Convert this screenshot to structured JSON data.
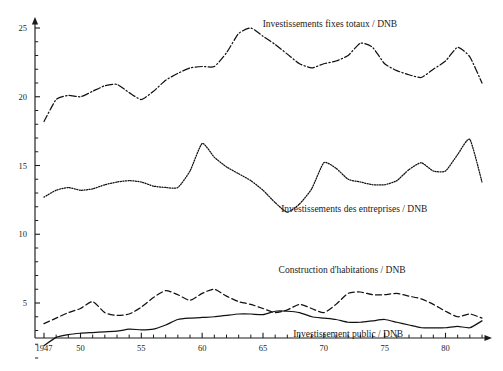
{
  "chart_data": {
    "type": "line",
    "title": "",
    "subtitle": "",
    "xlabel": "",
    "ylabel": "",
    "xlim": [
      1947,
      1983
    ],
    "ylim": [
      0,
      25.8
    ],
    "grid": false,
    "legend_position": "inline-annotations",
    "x_tick_labels": [
      "1947",
      "50",
      "55",
      "60",
      "65",
      "70",
      "75",
      "80"
    ],
    "x_tick_values": [
      1947,
      1950,
      1955,
      1960,
      1965,
      1970,
      1975,
      1980
    ],
    "x_minor_tick_step": 1,
    "y_tick_labels": [
      "5",
      "10",
      "15",
      "20",
      "25"
    ],
    "y_tick_values": [
      5,
      10,
      15,
      20,
      25
    ],
    "y_minor_tick_step": 1,
    "x": [
      1947,
      1948,
      1949,
      1950,
      1951,
      1952,
      1953,
      1954,
      1955,
      1956,
      1957,
      1958,
      1959,
      1960,
      1961,
      1962,
      1963,
      1964,
      1965,
      1966,
      1967,
      1968,
      1969,
      1970,
      1971,
      1972,
      1973,
      1974,
      1975,
      1976,
      1977,
      1978,
      1979,
      1980,
      1981,
      1982,
      1983
    ],
    "series": [
      {
        "name": "Investissements fixes totaux / DNB",
        "style": "dash-dot",
        "annotation": "Investissements fixes totaux / DNB",
        "annotation_x": 1970.5,
        "annotation_y": 25.1,
        "values": [
          18.2,
          19.8,
          20.1,
          20.0,
          20.4,
          20.8,
          20.9,
          20.3,
          19.8,
          20.4,
          21.2,
          21.7,
          22.1,
          22.2,
          22.2,
          23.2,
          24.6,
          25.0,
          24.4,
          23.8,
          23.1,
          22.4,
          22.1,
          22.4,
          22.6,
          23.0,
          23.9,
          23.6,
          22.4,
          21.9,
          21.6,
          21.4,
          22.0,
          22.6,
          23.6,
          22.9,
          21.0
        ]
      },
      {
        "name": "Investissements des entreprises / DNB",
        "style": "dotted",
        "annotation": "Investissements des entreprises / DNB",
        "annotation_x": 1972.5,
        "annotation_y": 11.6,
        "values": [
          12.7,
          13.2,
          13.4,
          13.2,
          13.3,
          13.6,
          13.8,
          13.9,
          13.8,
          13.5,
          13.4,
          13.4,
          14.6,
          16.6,
          15.6,
          14.9,
          14.4,
          13.9,
          13.2,
          12.3,
          11.6,
          12.2,
          13.3,
          15.2,
          14.8,
          14.0,
          13.8,
          13.6,
          13.6,
          13.9,
          14.7,
          15.2,
          14.6,
          14.6,
          15.8,
          16.9,
          13.8
        ]
      },
      {
        "name": "Construction d'habitations / DNB",
        "style": "dashed",
        "annotation": "Construction d'habitations / DNB",
        "annotation_x": 1971.5,
        "annotation_y": 7.2,
        "values": [
          3.5,
          3.9,
          4.3,
          4.6,
          5.1,
          4.3,
          4.1,
          4.2,
          4.7,
          5.4,
          5.9,
          5.6,
          5.2,
          5.7,
          6.0,
          5.5,
          5.1,
          4.9,
          4.6,
          4.3,
          4.5,
          4.9,
          4.6,
          4.3,
          4.9,
          5.7,
          5.8,
          5.6,
          5.6,
          5.7,
          5.5,
          5.3,
          4.9,
          4.4,
          4.0,
          4.2,
          3.9
        ]
      },
      {
        "name": "Investissement public / DNB",
        "style": "solid",
        "annotation": "Investissement public / DNB",
        "annotation_x": 1972.0,
        "annotation_y": 2.5,
        "values": [
          1.9,
          2.5,
          2.7,
          2.8,
          2.85,
          2.9,
          2.95,
          3.1,
          3.05,
          3.1,
          3.4,
          3.8,
          3.9,
          3.95,
          4.0,
          4.1,
          4.2,
          4.2,
          4.15,
          4.4,
          4.4,
          4.3,
          4.0,
          3.9,
          3.8,
          3.6,
          3.6,
          3.7,
          3.8,
          3.6,
          3.4,
          3.2,
          3.2,
          3.2,
          3.3,
          3.2,
          3.7
        ]
      }
    ]
  }
}
